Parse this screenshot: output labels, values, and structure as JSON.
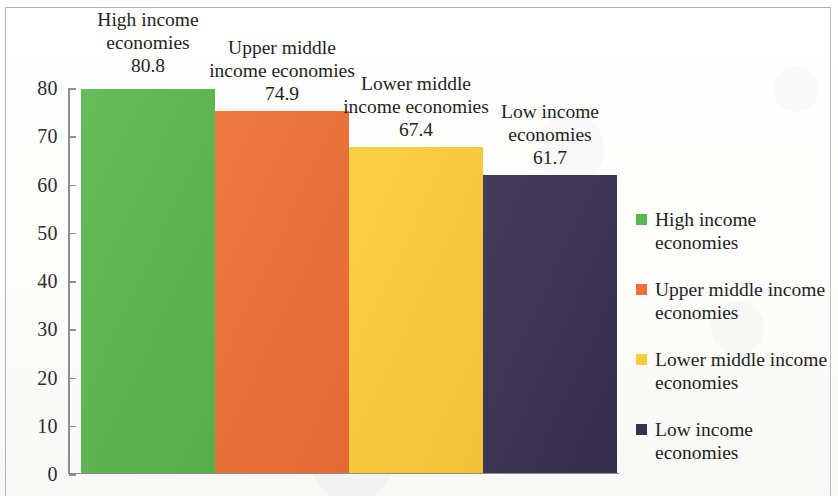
{
  "chart_data": {
    "type": "bar",
    "title": "",
    "subtitle": "",
    "xlabel": "",
    "ylabel": "",
    "ylim": [
      0,
      80
    ],
    "ytick_labels": [
      "0",
      "10",
      "20",
      "30",
      "40",
      "50",
      "60",
      "70",
      "80"
    ],
    "ytick_values": [
      0,
      10,
      20,
      30,
      40,
      50,
      60,
      70,
      80
    ],
    "grid": false,
    "legend_position": "right",
    "categories": [
      "High income economies",
      "Upper middle income economies",
      "Lower middle income economies",
      "Low income economies"
    ],
    "values": [
      80.8,
      74.9,
      67.4,
      61.7
    ],
    "value_labels": [
      "80.8",
      "74.9",
      "67.4",
      "61.7"
    ],
    "colors": [
      "#5bb84e",
      "#ef7035",
      "#fbcd37",
      "#373050"
    ],
    "series": [
      {
        "name": "",
        "values": [
          80.8,
          74.9,
          67.4,
          61.7
        ]
      }
    ],
    "bars": [
      {
        "label": "High income economies",
        "value": 80.8,
        "value_label": "80.8",
        "color": "#5bb84e"
      },
      {
        "label": "Upper middle income economies",
        "value": 74.9,
        "value_label": "74.9",
        "color": "#ef7035"
      },
      {
        "label": "Lower middle income economies",
        "value": 67.4,
        "value_label": "67.4",
        "color": "#fbcd37"
      },
      {
        "label": "Low income economies",
        "value": 61.7,
        "value_label": "61.7",
        "color": "#373050"
      }
    ],
    "legend": [
      {
        "label": "High income economies",
        "color": "#5bb84e"
      },
      {
        "label": "Upper middle income economies",
        "color": "#ef7035"
      },
      {
        "label": "Lower middle income economies",
        "color": "#fbcd37"
      },
      {
        "label": "Low income economies",
        "color": "#373050"
      }
    ]
  }
}
